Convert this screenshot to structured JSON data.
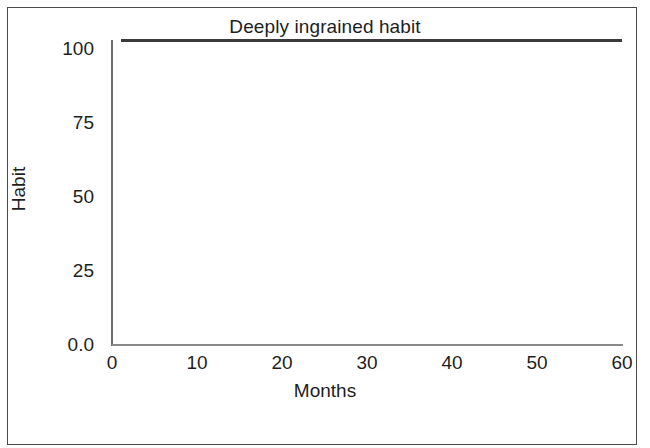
{
  "chart_data": {
    "type": "line",
    "title": "Deeply ingrained habit",
    "xlabel": "Months",
    "ylabel": "Habit",
    "xlim": [
      0,
      60
    ],
    "ylim": [
      0,
      103
    ],
    "xticks": [
      "0",
      "10",
      "20",
      "30",
      "40",
      "50",
      "60"
    ],
    "xtick_values": [
      0,
      10,
      20,
      30,
      40,
      50,
      60
    ],
    "yticks": [
      "0.0",
      "25",
      "50",
      "75",
      "100"
    ],
    "ytick_values": [
      0,
      25,
      50,
      75,
      100
    ],
    "grid": false,
    "legend": "none",
    "series": [
      {
        "name": "Habit",
        "color": "#3a3a3a",
        "x": [
          1,
          60
        ],
        "values": [
          103,
          103
        ]
      }
    ]
  },
  "axes": {
    "title": "Deeply ingrained habit",
    "x_label": "Months",
    "y_label": "Habit"
  }
}
